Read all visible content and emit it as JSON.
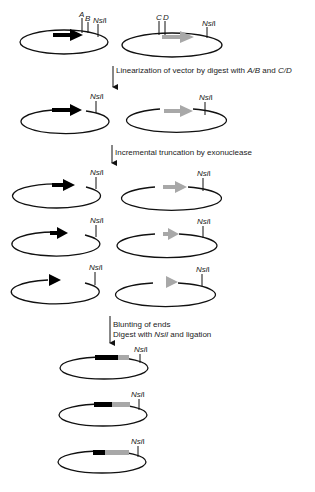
{
  "diagram": {
    "colors": {
      "gene_a": "#000000",
      "gene_b": "#a8a8a8",
      "line": "#111111",
      "text": "#222222"
    },
    "row1": {
      "left": {
        "sites": [
          "A",
          "B",
          "NsiI"
        ]
      },
      "right": {
        "sites": [
          "C",
          "D",
          "NsiI"
        ]
      }
    },
    "steps": [
      {
        "text_plain": "Linearization of vector by digest with ",
        "text_italic1": "A/B",
        "text_mid": " and ",
        "text_italic2": "C/D"
      },
      {
        "text_plain": "Incremental truncation by exonuclease"
      },
      {
        "line1": "Blunting of ends",
        "line2_pre": "Digest with ",
        "line2_italic": "NsiI",
        "line2_post": " and ligation"
      }
    ],
    "site_label": "NsiI",
    "site_label_italic": "Nsi",
    "site_label_roman": "I"
  }
}
